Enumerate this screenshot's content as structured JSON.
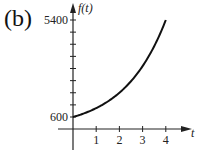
{
  "panel_label": "(b)",
  "chart_data": {
    "type": "line",
    "title": "",
    "xlabel": "t",
    "ylabel": "f(t)",
    "x_ticks": [
      "1",
      "2",
      "3",
      "4"
    ],
    "y_tick_labels": [
      "600",
      "5400"
    ],
    "y_tick_step": 600,
    "xlim": [
      0,
      4.8
    ],
    "ylim": [
      0,
      5400
    ],
    "grid": false,
    "legend": null,
    "series": [
      {
        "name": "f(t)",
        "x": [
          0,
          0.5,
          1,
          1.5,
          2,
          2.5,
          3,
          3.5,
          4
        ],
        "values": [
          600,
          790,
          1039,
          1368,
          1800,
          2369,
          3118,
          4103,
          5400
        ]
      }
    ]
  }
}
